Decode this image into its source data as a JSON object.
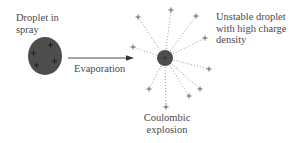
{
  "diagram": {
    "labels": {
      "droplet_in_spray": [
        "Droplet in",
        "spray"
      ],
      "evaporation": "Evaporation",
      "unstable_droplet": [
        "Unstable droplet",
        "with high charge",
        "density"
      ],
      "coulombic_explosion": [
        "Coulombic",
        "explosion"
      ]
    },
    "colors": {
      "droplet_fill": "#4d4d4d",
      "plus": "#555555",
      "dotted_line": "#999999",
      "arrow": "#333333",
      "text": "#4a4a4a"
    },
    "large_droplet": {
      "cx": 45,
      "cy": 56,
      "rx": 17,
      "ry": 19,
      "charges": 4
    },
    "small_droplet": {
      "cx": 165,
      "cy": 58,
      "r": 8
    },
    "emitted_charges": 10,
    "charge_symbol": "+"
  }
}
